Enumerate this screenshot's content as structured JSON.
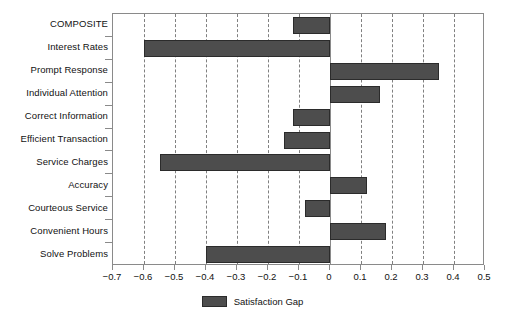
{
  "chart_data": {
    "type": "bar",
    "orientation": "horizontal",
    "title": "",
    "xlabel": "",
    "ylabel": "",
    "xlim": [
      -0.7,
      0.5
    ],
    "xticks": [
      -0.7,
      -0.6,
      -0.5,
      -0.4,
      -0.3,
      -0.2,
      -0.1,
      0,
      0.1,
      0.2,
      0.3,
      0.4,
      0.5
    ],
    "xtick_labels": [
      "-0.7",
      "-0.6",
      "-0.5",
      "-0.4",
      "-0.3",
      "-0.2",
      "-0.1",
      "0",
      "0.1",
      "0.2",
      "0.3",
      "0.4",
      "0.5"
    ],
    "grid": "vertical-dashed",
    "legend_position": "bottom-center",
    "series_name": "Satisfaction Gap",
    "bar_color": "#4d4d4d",
    "bar_edge_color": "#2b2b2b",
    "categories": [
      "COMPOSITE",
      "Interest Rates",
      "Prompt Response",
      "Individual Attention",
      "Correct Information",
      "Efficient Transaction",
      "Service Charges",
      "Accuracy",
      "Courteous Service",
      "Convenient Hours",
      "Solve Problems"
    ],
    "values": [
      -0.12,
      -0.6,
      0.35,
      0.16,
      -0.12,
      -0.15,
      -0.55,
      0.12,
      -0.08,
      0.18,
      -0.4
    ]
  },
  "legend": {
    "label": "Satisfaction Gap"
  }
}
